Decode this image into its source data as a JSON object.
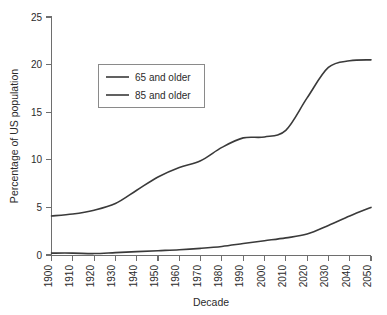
{
  "chart_data": {
    "type": "line",
    "title": "",
    "xlabel": "Decade",
    "ylabel": "Percentage of US population",
    "xlim": [
      1900,
      2050
    ],
    "ylim": [
      0,
      25
    ],
    "grid": false,
    "legend_position": "upper-left-inside",
    "x": [
      1900,
      1910,
      1920,
      1930,
      1940,
      1950,
      1960,
      1970,
      1980,
      1990,
      2000,
      2010,
      2020,
      2030,
      2040,
      2050
    ],
    "xticklabels": [
      "1900",
      "1910",
      "1920",
      "1930",
      "1940",
      "1950",
      "1960",
      "1970",
      "1980",
      "1990",
      "2000",
      "2010",
      "2020",
      "2030",
      "2040",
      "2050"
    ],
    "yticklabels": [
      "0",
      "5",
      "10",
      "15",
      "20",
      "25"
    ],
    "yticks": [
      0,
      5,
      10,
      15,
      20,
      25
    ],
    "series": [
      {
        "name": "65 and older",
        "values": [
          4.1,
          4.3,
          4.7,
          5.4,
          6.8,
          8.2,
          9.2,
          9.9,
          11.3,
          12.3,
          12.4,
          13.1,
          16.5,
          19.7,
          20.4,
          20.5
        ],
        "color": "#3a3a3a"
      },
      {
        "name": "85 and older",
        "values": [
          0.2,
          0.2,
          0.15,
          0.25,
          0.35,
          0.45,
          0.55,
          0.7,
          0.9,
          1.2,
          1.5,
          1.8,
          2.2,
          3.1,
          4.1,
          5.0
        ],
        "color": "#3a3a3a"
      }
    ]
  },
  "legend": {
    "items": [
      {
        "label": "65 and older"
      },
      {
        "label": "85 and older"
      }
    ]
  },
  "axes": {
    "x_title": "Decade",
    "y_title": "Percentage of US population"
  }
}
